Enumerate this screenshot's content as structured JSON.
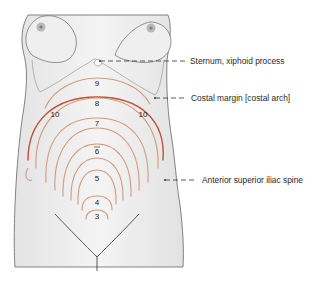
{
  "figure": {
    "labels": [
      {
        "id": "sternum",
        "text": "Sternum, xiphoid process",
        "x": 190,
        "y": 57
      },
      {
        "id": "costal",
        "text": "Costal margin [costal arch]",
        "x": 191,
        "y": 94
      },
      {
        "id": "asis",
        "text": "Anterior superior iliac spine",
        "x": 202,
        "y": 176
      }
    ],
    "arc_numbers": [
      {
        "text": "9",
        "x": 97,
        "y": 84
      },
      {
        "text": "8",
        "x": 97,
        "y": 104
      },
      {
        "text": "10",
        "x": 55,
        "y": 115
      },
      {
        "text": "10",
        "x": 143,
        "y": 115
      },
      {
        "text": "7",
        "x": 97,
        "y": 124
      },
      {
        "text": "6",
        "x": 97,
        "y": 152
      },
      {
        "text": "5",
        "x": 97,
        "y": 179
      },
      {
        "text": "4",
        "x": 97,
        "y": 203
      },
      {
        "text": "3",
        "x": 97,
        "y": 217
      }
    ],
    "colors": {
      "arc_light": "#d39a7a",
      "arc_dark": "#c0503a",
      "skin": "#eeeeee",
      "outline": "#555555",
      "leader": "#333333"
    }
  }
}
